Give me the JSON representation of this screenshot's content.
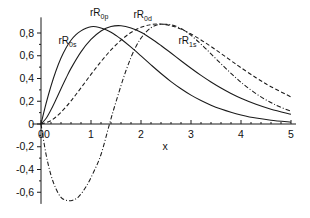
{
  "chart_data": {
    "type": "line",
    "title": "",
    "subtitle": "",
    "xlabel": "x",
    "ylabel": "",
    "grid": false,
    "legend_position": "inline-annotations",
    "xlim": [
      -0.15,
      5.0
    ],
    "ylim": [
      -0.72,
      0.92
    ],
    "xticks": [
      "0",
      "1",
      "2",
      "3",
      "4",
      "5"
    ],
    "xtick_values": [
      0,
      1,
      2,
      3,
      4,
      5
    ],
    "yticks": [
      "0,8",
      "0,6",
      "0,4",
      "0,2",
      "0",
      "-0,2",
      "-0,4",
      "-0,6"
    ],
    "ytick_values": [
      0.8,
      0.6,
      0.4,
      0.2,
      0,
      -0.2,
      -0.4,
      -0.6
    ],
    "decimal_separator": ",",
    "series": [
      {
        "name": "rR0s",
        "label_text": "rR",
        "label_sub": "0s",
        "style": "solid",
        "color": "#1a1a1a",
        "label_x": 0.35,
        "label_y": 0.7,
        "peak_x": 1.0,
        "peak_y": 0.855,
        "x": [
          0,
          0.1,
          0.2,
          0.3,
          0.4,
          0.5,
          0.6,
          0.7,
          0.8,
          0.9,
          1.0,
          1.1,
          1.2,
          1.3,
          1.4,
          1.5,
          1.6,
          1.8,
          2.0,
          2.2,
          2.4,
          2.6,
          2.8,
          3.0,
          3.2,
          3.4,
          3.6,
          3.8,
          4.0,
          4.3,
          4.6,
          5.0
        ],
        "y": [
          0,
          0.178,
          0.334,
          0.468,
          0.58,
          0.669,
          0.736,
          0.785,
          0.819,
          0.841,
          0.855,
          0.855,
          0.845,
          0.828,
          0.806,
          0.778,
          0.747,
          0.675,
          0.598,
          0.52,
          0.444,
          0.373,
          0.31,
          0.254,
          0.206,
          0.165,
          0.131,
          0.103,
          0.08,
          0.052,
          0.033,
          0.016
        ]
      },
      {
        "name": "rR0p",
        "label_text": "rR",
        "label_sub": "0p",
        "style": "solid",
        "color": "#1a1a1a",
        "label_x": 0.98,
        "label_y": 0.95,
        "peak_x": 1.42,
        "peak_y": 0.86,
        "x": [
          0,
          0.1,
          0.2,
          0.3,
          0.4,
          0.5,
          0.6,
          0.8,
          1.0,
          1.2,
          1.4,
          1.6,
          1.8,
          2.0,
          2.2,
          2.4,
          2.6,
          2.8,
          3.0,
          3.2,
          3.4,
          3.6,
          3.8,
          4.0,
          4.3,
          4.6,
          5.0
        ],
        "y": [
          0,
          0.048,
          0.125,
          0.215,
          0.31,
          0.402,
          0.489,
          0.634,
          0.743,
          0.818,
          0.857,
          0.864,
          0.845,
          0.806,
          0.752,
          0.69,
          0.624,
          0.556,
          0.49,
          0.427,
          0.369,
          0.316,
          0.268,
          0.226,
          0.173,
          0.13,
          0.086
        ]
      },
      {
        "name": "rR0d",
        "label_text": "rR",
        "label_sub": "0d",
        "style": "dashed",
        "color": "#1a1a1a",
        "label_x": 1.85,
        "label_y": 0.93,
        "peak_x": 2.05,
        "peak_y": 0.875,
        "x": [
          0,
          0.2,
          0.4,
          0.6,
          0.8,
          1.0,
          1.2,
          1.4,
          1.6,
          1.8,
          2.0,
          2.2,
          2.4,
          2.6,
          2.8,
          3.0,
          3.2,
          3.4,
          3.6,
          3.8,
          4.0,
          4.3,
          4.6,
          5.0
        ],
        "y": [
          0,
          0.03,
          0.103,
          0.203,
          0.318,
          0.436,
          0.549,
          0.651,
          0.737,
          0.804,
          0.85,
          0.874,
          0.878,
          0.864,
          0.834,
          0.791,
          0.739,
          0.681,
          0.62,
          0.557,
          0.495,
          0.407,
          0.328,
          0.238
        ]
      },
      {
        "name": "rR1s",
        "label_text": "rR",
        "label_sub": "1s",
        "style": "dashdot",
        "color": "#1a1a1a",
        "label_x": 2.75,
        "label_y": 0.7,
        "peak_x": 2.52,
        "peak_y": 0.875,
        "min_x": 0.62,
        "min_y": -0.672,
        "zero_crossing_x": 1.37,
        "x": [
          0,
          0.1,
          0.2,
          0.3,
          0.4,
          0.5,
          0.62,
          0.75,
          0.9,
          1.05,
          1.2,
          1.37,
          1.5,
          1.7,
          1.9,
          2.1,
          2.3,
          2.52,
          2.7,
          2.9,
          3.1,
          3.3,
          3.5,
          3.7,
          3.9,
          4.1,
          4.4,
          4.7,
          5.0
        ],
        "y": [
          0,
          -0.265,
          -0.45,
          -0.57,
          -0.645,
          -0.67,
          -0.672,
          -0.64,
          -0.552,
          -0.425,
          -0.268,
          0.0,
          0.195,
          0.47,
          0.682,
          0.808,
          0.868,
          0.877,
          0.86,
          0.812,
          0.742,
          0.66,
          0.573,
          0.487,
          0.405,
          0.331,
          0.238,
          0.166,
          0.112
        ]
      }
    ]
  },
  "axis": {
    "x_label": "x",
    "zero_label": "0"
  }
}
